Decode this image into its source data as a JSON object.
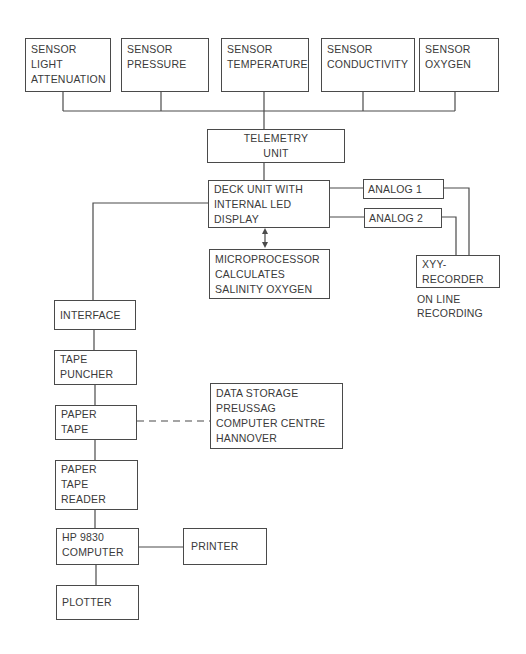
{
  "sensors": [
    {
      "lines": [
        "SENSOR",
        "LIGHT",
        "ATTENUATION"
      ]
    },
    {
      "lines": [
        "SENSOR",
        "PRESSURE"
      ]
    },
    {
      "lines": [
        "SENSOR",
        "TEMPERATURE"
      ]
    },
    {
      "lines": [
        "SENSOR",
        "CONDUCTIVITY"
      ]
    },
    {
      "lines": [
        "SENSOR",
        "OXYGEN"
      ]
    }
  ],
  "telemetry": {
    "lines": [
      "TELEMETRY",
      "UNIT"
    ]
  },
  "deck_unit": {
    "lines": [
      "DECK UNIT WITH",
      "INTERNAL LED",
      "DISPLAY"
    ]
  },
  "analog1": {
    "label": "ANALOG 1"
  },
  "analog2": {
    "label": "ANALOG 2"
  },
  "microprocessor": {
    "lines": [
      "MICROPROCESSOR",
      "CALCULATES",
      "SALINITY  OXYGEN"
    ]
  },
  "recorder": {
    "lines": [
      "XYY-",
      "RECORDER"
    ],
    "note": [
      "ON LINE",
      "RECORDING"
    ]
  },
  "interface": {
    "label": "INTERFACE"
  },
  "tape_puncher": {
    "lines": [
      "TAPE",
      "PUNCHER"
    ]
  },
  "paper_tape": {
    "lines": [
      "PAPER",
      "TAPE"
    ]
  },
  "data_storage": {
    "lines": [
      "DATA STORAGE",
      "PREUSSAG",
      "COMPUTER CENTRE",
      "HANNOVER"
    ]
  },
  "paper_tape_reader": {
    "lines": [
      "PAPER",
      "TAPE",
      "READER"
    ]
  },
  "computer": {
    "lines": [
      "HP 9830",
      "COMPUTER"
    ]
  },
  "printer": {
    "label": "PRINTER"
  },
  "plotter": {
    "label": "PLOTTER"
  },
  "colors": {
    "line": "#4a4a4a",
    "text": "#3a3a3a",
    "background": "#ffffff"
  }
}
